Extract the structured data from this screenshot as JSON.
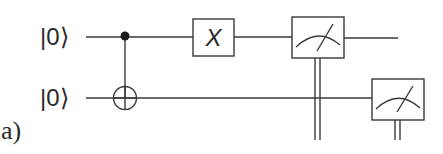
{
  "panel": {
    "label": "a)"
  },
  "qubits": [
    {
      "id": "q0",
      "initial_state": "|0⟩"
    },
    {
      "id": "q1",
      "initial_state": "|0⟩"
    }
  ],
  "gates": [
    {
      "type": "CNOT",
      "control": "q0",
      "target": "q1",
      "control_icon": "filled-dot",
      "target_icon": "circle-plus"
    },
    {
      "type": "X",
      "qubit": "q0",
      "label": "X"
    },
    {
      "type": "measure",
      "qubit": "q0",
      "icon": "meter-icon",
      "classical_output": "double-line"
    },
    {
      "type": "measure",
      "qubit": "q1",
      "icon": "meter-icon",
      "classical_output": "double-line"
    }
  ],
  "colors": {
    "line": "#3a3a3a",
    "text": "#2a2a2a",
    "background": "#ffffff"
  }
}
